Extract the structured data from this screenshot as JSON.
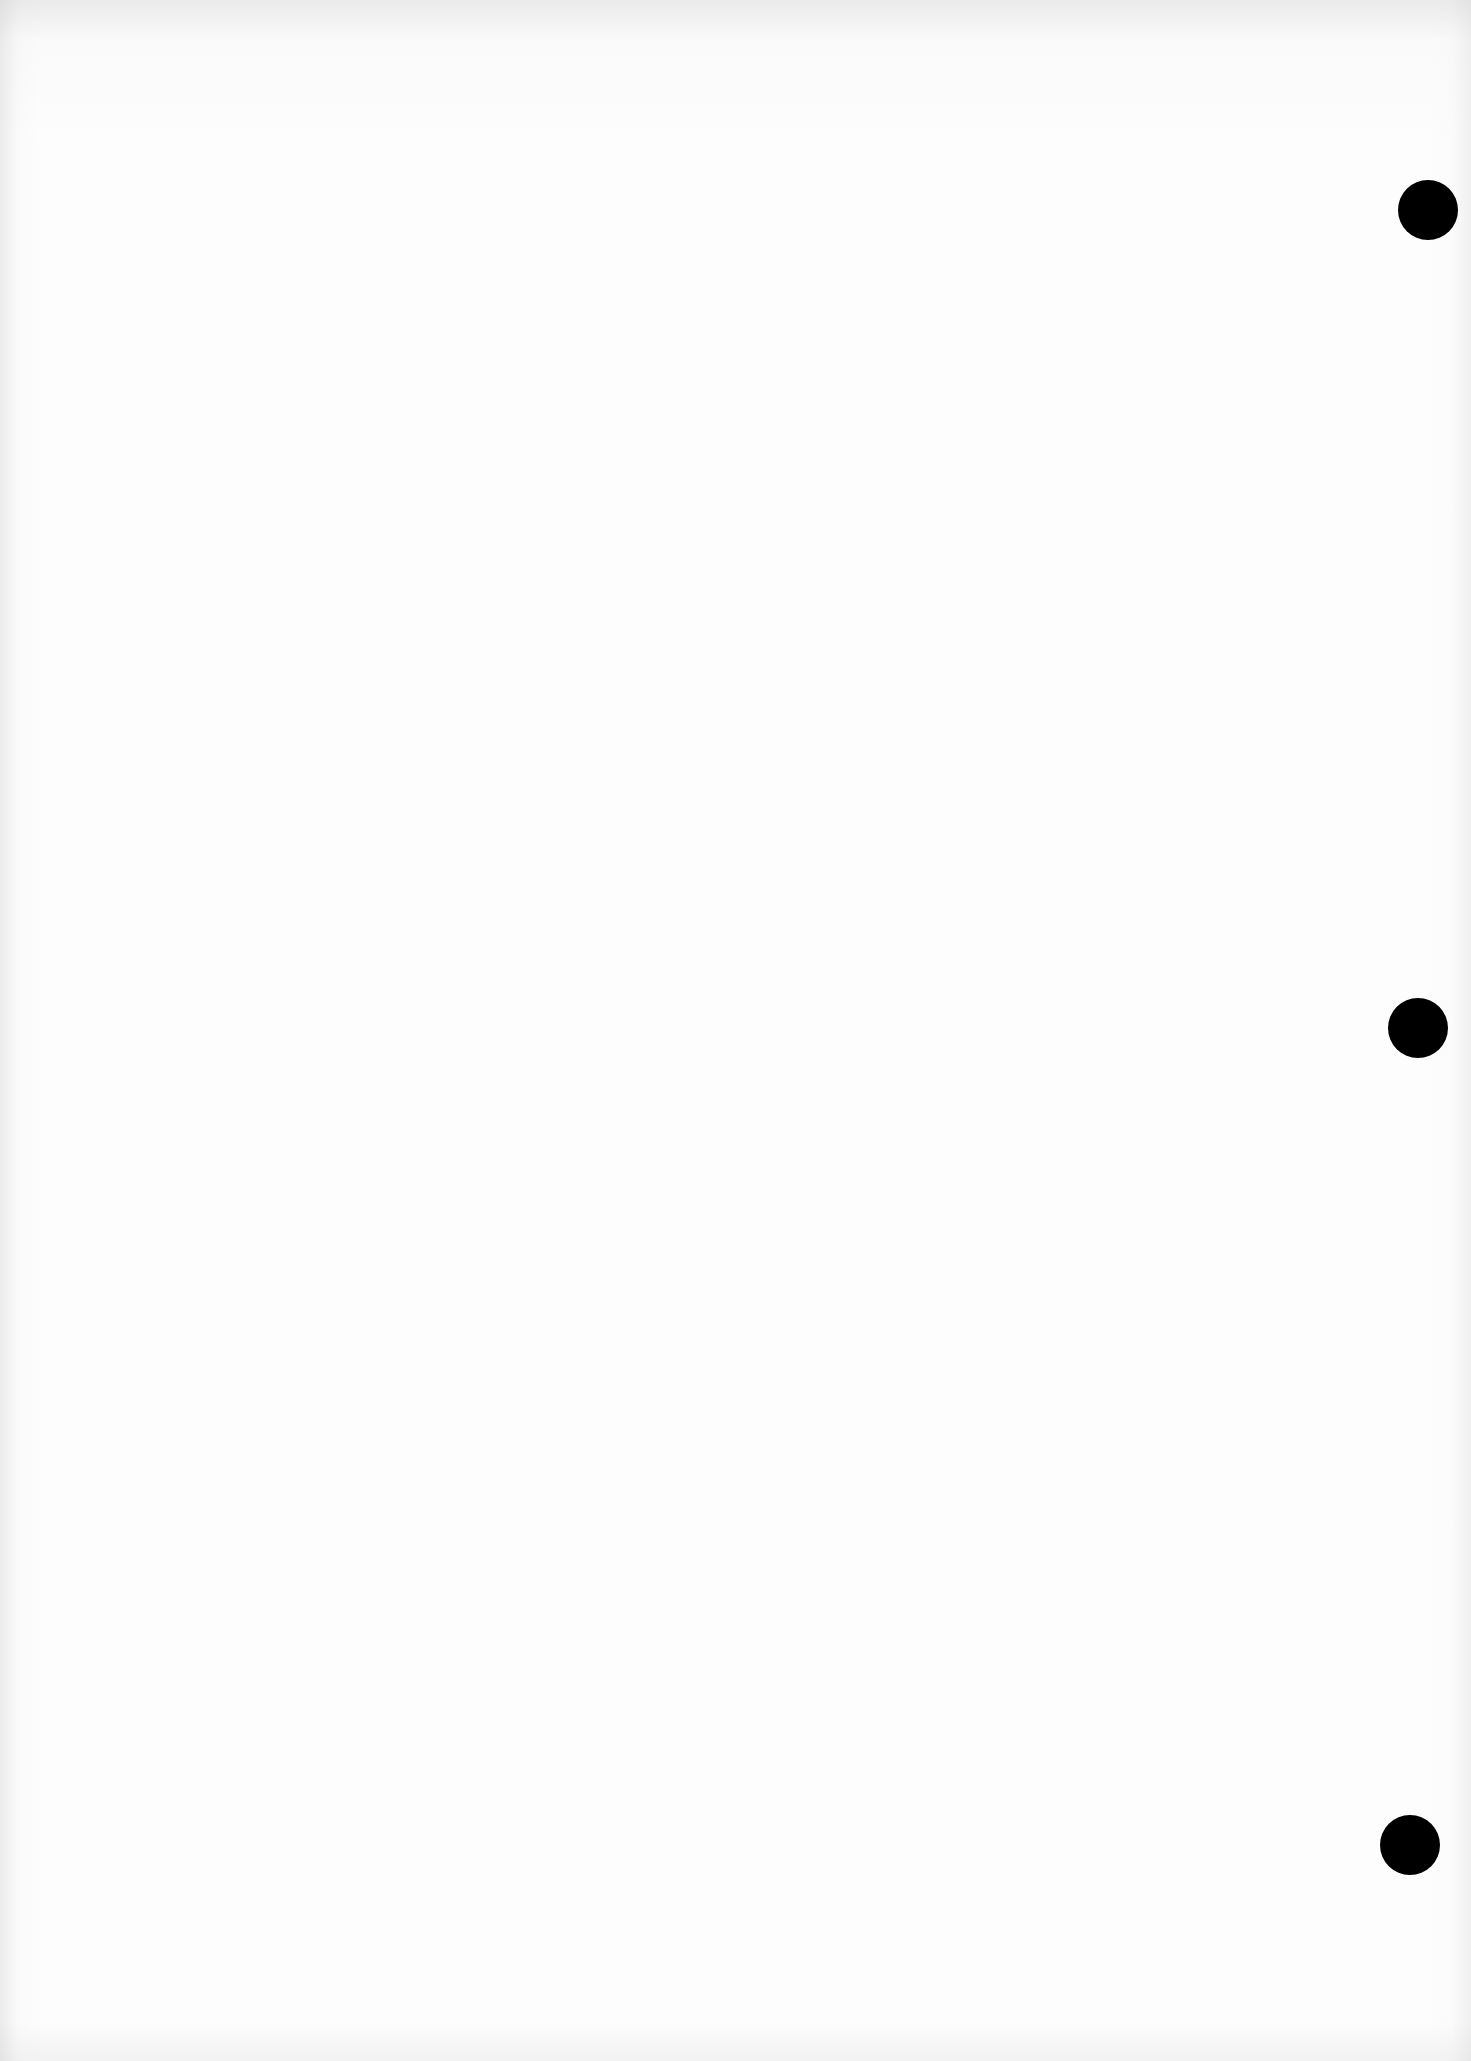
{
  "page": {
    "type": "blank scanned page",
    "background_color": "#fdfdfd",
    "text_content": ""
  },
  "punch_holes": [
    {
      "label": "top",
      "cx": 1428,
      "cy": 210,
      "diameter": 60,
      "color": "#000000"
    },
    {
      "label": "middle",
      "cx": 1418,
      "cy": 1028,
      "diameter": 60,
      "color": "#000000"
    },
    {
      "label": "bottom",
      "cx": 1410,
      "cy": 1845,
      "diameter": 60,
      "color": "#000000"
    }
  ]
}
